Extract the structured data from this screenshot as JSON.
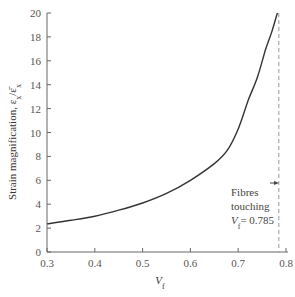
{
  "chart_data": {
    "type": "line",
    "title": "",
    "xlabel": "V",
    "xlabel_sub": "f",
    "ylabel": "Strain magnification, ε",
    "ylabel_sub1": "x",
    "ylabel_mid": "/ε̄",
    "ylabel_sub2": "x",
    "xlim": [
      0.3,
      0.8
    ],
    "ylim": [
      0,
      20
    ],
    "xticks": [
      0.3,
      0.4,
      0.5,
      0.6,
      0.7,
      0.8
    ],
    "xtick_labels": [
      "0.3",
      "0.4",
      "0.5",
      "0.6",
      "0.7",
      "0.8"
    ],
    "yticks": [
      0,
      2,
      4,
      6,
      8,
      10,
      12,
      14,
      16,
      18,
      20
    ],
    "ytick_labels": [
      "0",
      "2",
      "4",
      "6",
      "8",
      "10",
      "12",
      "14",
      "16",
      "18",
      "20"
    ],
    "grid": false,
    "series": [
      {
        "name": "strain magnification",
        "x": [
          0.3,
          0.35,
          0.4,
          0.45,
          0.5,
          0.55,
          0.6,
          0.65,
          0.677,
          0.7,
          0.721,
          0.74,
          0.757,
          0.77,
          0.782
        ],
        "y": [
          2.35,
          2.65,
          3.0,
          3.5,
          4.1,
          4.9,
          6.0,
          7.4,
          8.5,
          10.3,
          12.7,
          14.6,
          16.9,
          18.4,
          20.0
        ]
      }
    ],
    "reference_line": {
      "x": 0.785,
      "style": "dashed"
    },
    "annotation": {
      "lines": [
        "Fibres",
        "touching"
      ],
      "value_label_prefix": "V",
      "value_label_sub": "f",
      "value_label_suffix": "= 0.785"
    }
  }
}
